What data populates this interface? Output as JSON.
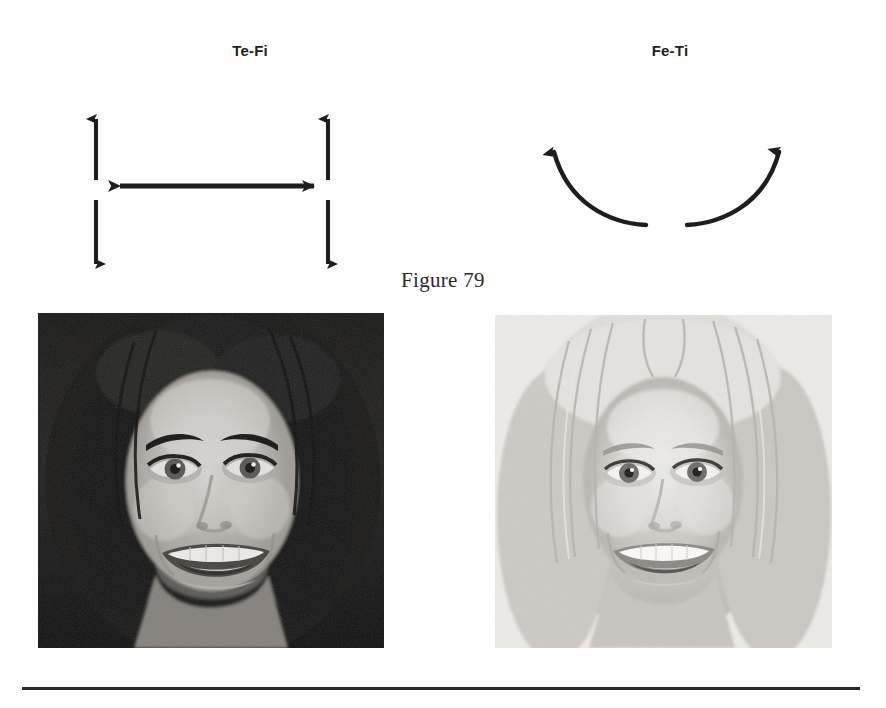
{
  "figure": {
    "caption": "Figure 79",
    "columns": [
      {
        "label": "Te-Fi",
        "diagram_name": "straight-double-arrows",
        "description": "Two vertical double-headed arrows joined by a horizontal double-headed arrow"
      },
      {
        "label": "Fe-Ti",
        "diagram_name": "curved-upward-arcs",
        "description": "Two upward curving arcs forming an open U with arrowheads at the top"
      }
    ],
    "photos": [
      {
        "name": "portrait-dark-hair",
        "alt": "Black and white portrait of a smiling woman with dark curly hair",
        "tone": "dark"
      },
      {
        "name": "portrait-light-hair",
        "alt": "Black and white portrait of a smiling woman with light blonde hair",
        "tone": "light"
      }
    ],
    "divider": "horizontal-rule"
  },
  "colors": {
    "ink": "#231f20",
    "rule": "#2a2a2a",
    "page": "#fefefe"
  }
}
